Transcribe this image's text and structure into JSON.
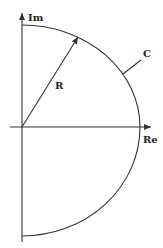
{
  "diagram": {
    "axes": {
      "imaginary_label": "Im",
      "real_label": "Re"
    },
    "radius_label": "R",
    "contour_label": "C",
    "colors": {
      "stroke": "#333333",
      "text": "#222222",
      "background": "#ffffff"
    }
  }
}
